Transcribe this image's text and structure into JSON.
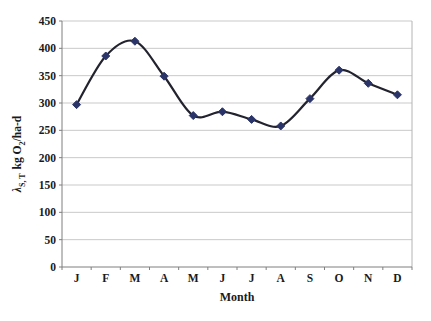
{
  "chart_data": {
    "type": "line",
    "smoothed": true,
    "title": "",
    "xlabel": "Month",
    "ylabel": {
      "symbol": "λ",
      "symbol_subscript": "S, T",
      "unit_pre": "kg O",
      "unit_sub": "2",
      "unit_post": "/ha-d"
    },
    "categories": [
      "J",
      "F",
      "M",
      "A",
      "M",
      "J",
      "J",
      "A",
      "S",
      "O",
      "N",
      "D"
    ],
    "series": [
      {
        "name": "areal-oxygen-rate",
        "values": [
          297,
          386,
          413,
          349,
          277,
          284,
          270,
          258,
          308,
          360,
          336,
          315
        ]
      }
    ],
    "ylim": [
      0,
      450
    ],
    "ytick_step": 50,
    "ytick_labels": [
      "0",
      "50",
      "100",
      "150",
      "200",
      "250",
      "300",
      "350",
      "400",
      "450"
    ],
    "grid": "horizontal",
    "legend": "none",
    "marker": "diamond",
    "colors": {
      "line": "#23232f",
      "marker": "#2b3468",
      "grid": "#c9c9c9",
      "plot_border": "#b4b4b4",
      "axis": "#7f7f7f",
      "text": "#1a1a1a",
      "background": "#ffffff"
    }
  }
}
